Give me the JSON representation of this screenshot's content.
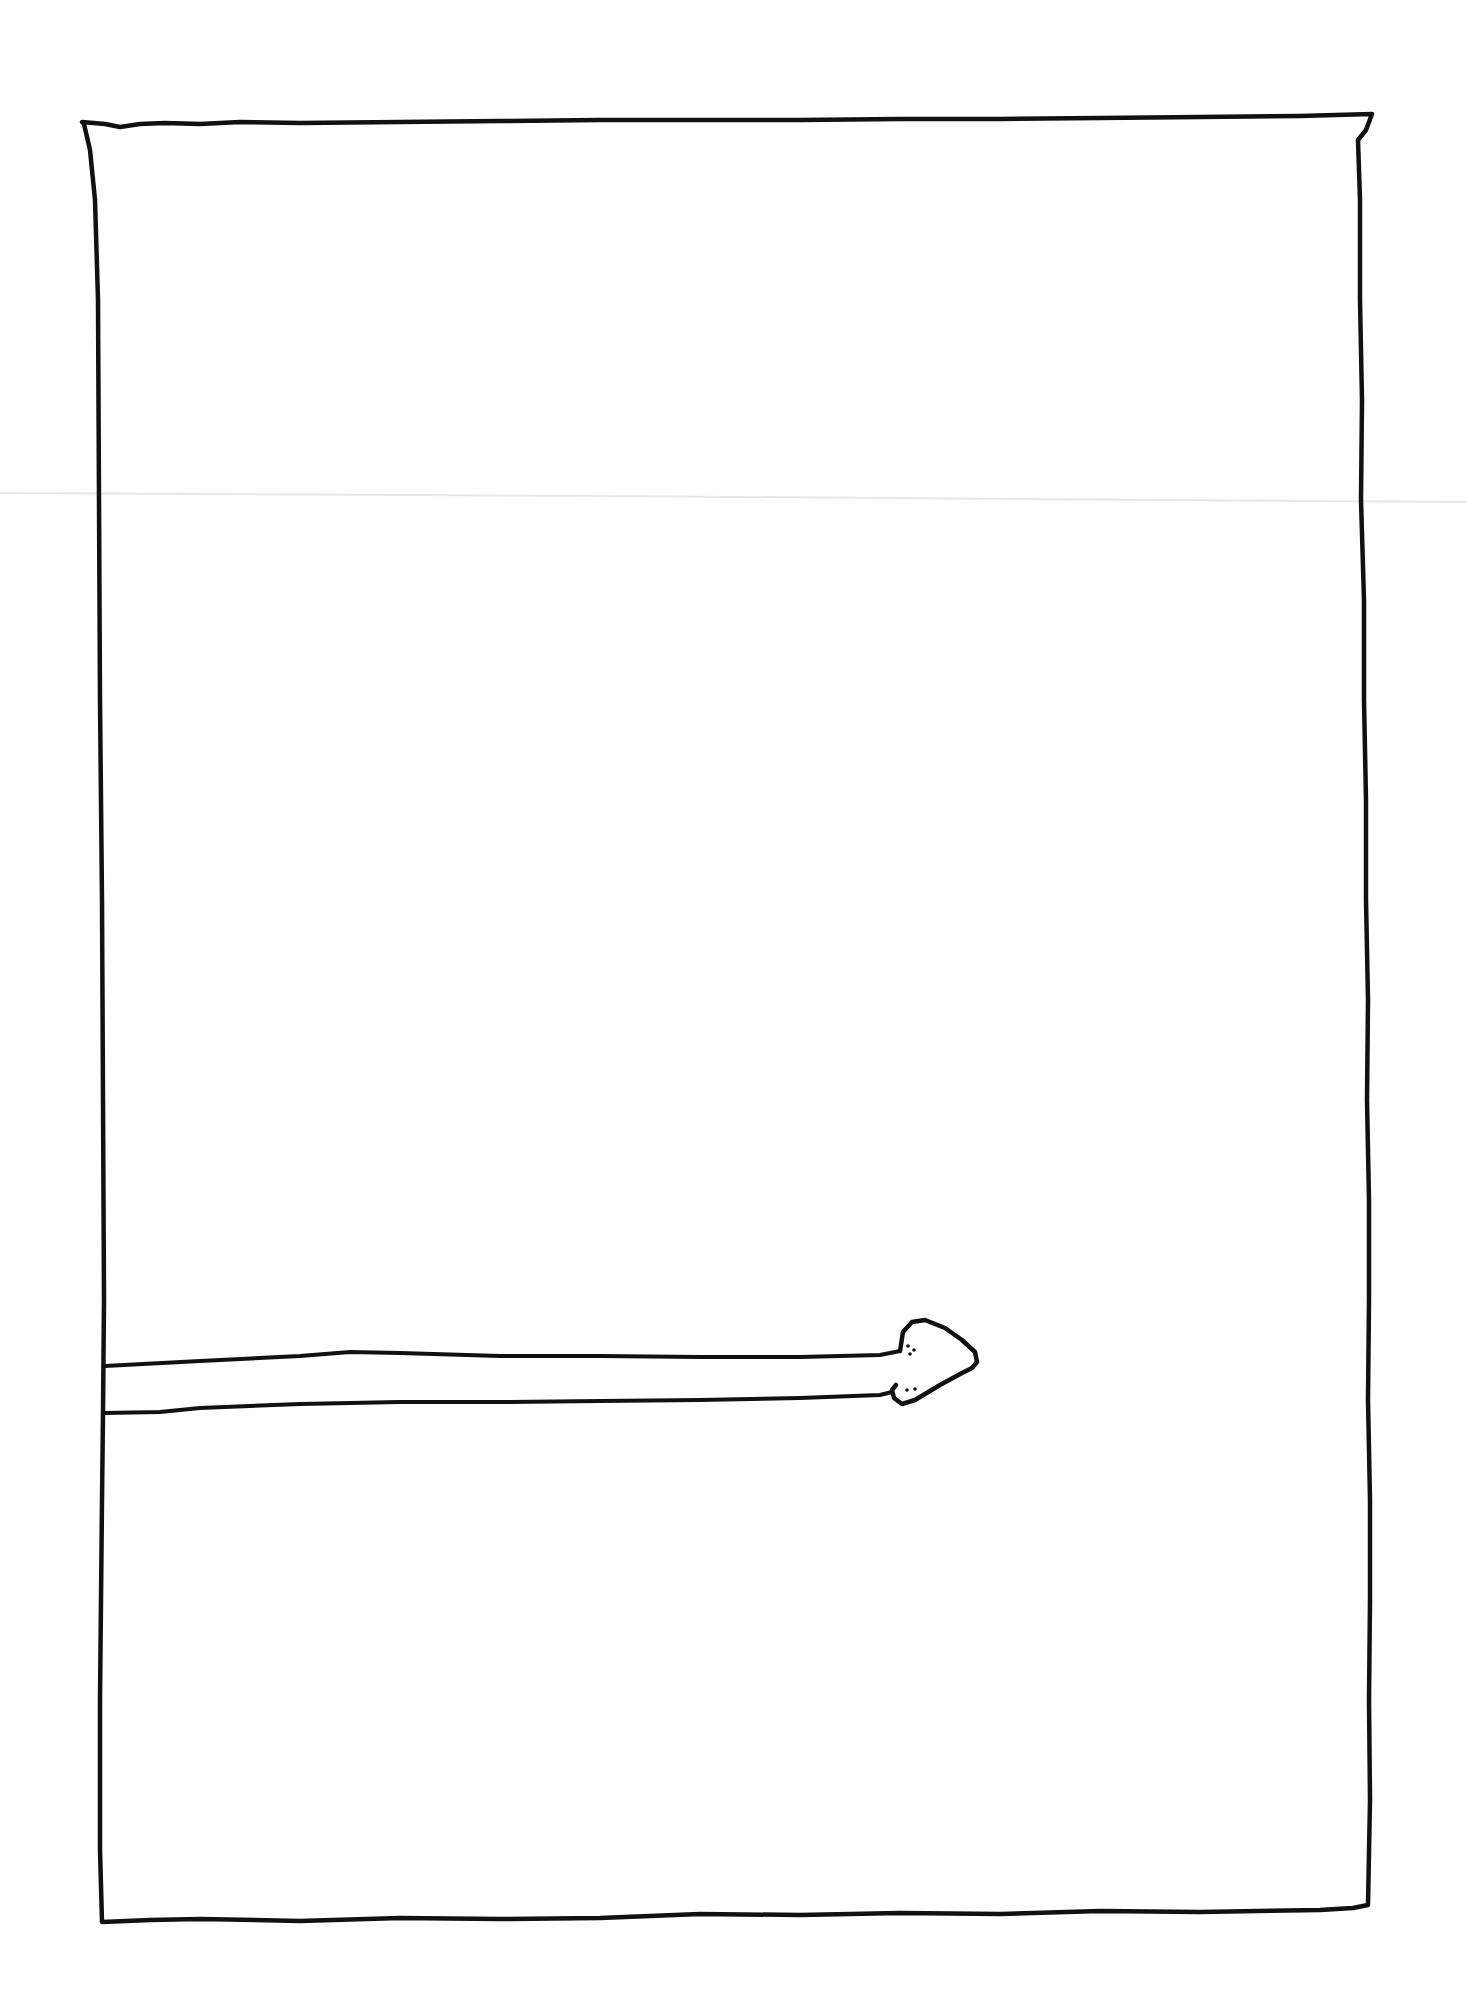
{
  "drawing": {
    "description": "Hand-drawn rectangle with a horizontal arrow entering from the left edge and pointing right",
    "ink_color": "#111111",
    "paper_color": "#ffffff",
    "fold_line_color": "#e6e6e6",
    "frame": {
      "x1": 80,
      "y1": 120,
      "x2": 1370,
      "y2": 1920
    },
    "arrow": {
      "tail_x": 105,
      "y_top": 1356,
      "y_bottom": 1412,
      "head_tip_x": 978,
      "head_tip_y": 1355,
      "direction": "right"
    }
  }
}
